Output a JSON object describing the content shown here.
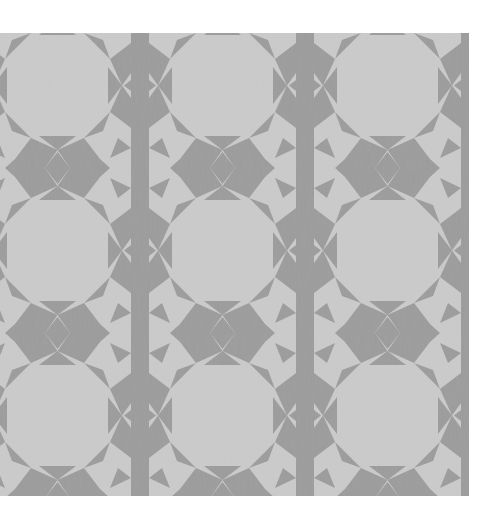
{
  "image": {
    "subject": "geometric islamic star tile quilt pattern",
    "background_color": "#ffffff",
    "light_color": "#cbcbcb",
    "dark_color": "#9b9b9b",
    "tile_period_px": 165,
    "rows_visible": 3,
    "columns_visible": 3
  }
}
